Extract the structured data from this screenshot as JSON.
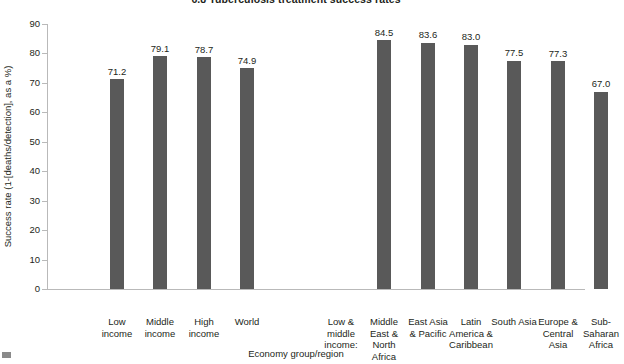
{
  "chart_data": {
    "type": "bar",
    "title": "6.8 Tuberculosis treatment success rates",
    "xlabel": "Economy group/region",
    "ylabel": "Success rate (1-[deaths/detection], as a %)",
    "ylim": [
      0,
      90
    ],
    "ytick_step": 10,
    "ytick_labels": [
      "0",
      "10",
      "20",
      "30",
      "40",
      "50",
      "60",
      "70",
      "80",
      "90"
    ],
    "grid": false,
    "legend": null,
    "bar_color": "#595959",
    "axis_color": "#b9b9b9",
    "groups": [
      {
        "group_label": "",
        "categories": [
          "Low income",
          "Middle income",
          "High income",
          "World"
        ],
        "values": [
          71.2,
          79.1,
          78.7,
          74.9
        ],
        "value_labels": [
          "71.2",
          "79.1",
          "78.7",
          "74.9"
        ]
      },
      {
        "group_label": "Low & middle income:",
        "categories": [
          "Middle East & North Africa",
          "East Asia & Pacific",
          "Latin America & Caribbean",
          "South Asia",
          "Europe & Central Asia",
          "Sub-Saharan Africa"
        ],
        "values": [
          84.5,
          83.6,
          83.0,
          77.5,
          77.3,
          67.0
        ],
        "value_labels": [
          "84.5",
          "83.6",
          "83.0",
          "77.5",
          "77.3",
          "67.0"
        ]
      }
    ],
    "categories": [
      "Low income",
      "Middle income",
      "High income",
      "World",
      "Low & middle income:",
      "Middle East & North Africa",
      "East Asia & Pacific",
      "Latin America & Caribbean",
      "South Asia",
      "Europe & Central Asia",
      "Sub-Saharan Africa"
    ],
    "values": [
      71.2,
      79.1,
      78.7,
      74.9,
      null,
      84.5,
      83.6,
      83.0,
      77.5,
      77.3,
      67.0
    ],
    "bars": [
      {
        "label": "Low income",
        "label_lines": [
          "Low",
          "income"
        ],
        "value": 71.2,
        "value_label": "71.2",
        "cx": 70
      },
      {
        "label": "Middle income",
        "label_lines": [
          "Middle",
          "income"
        ],
        "value": 79.1,
        "value_label": "79.1",
        "cx": 113
      },
      {
        "label": "High income",
        "label_lines": [
          "High",
          "income"
        ],
        "value": 78.7,
        "value_label": "78.7",
        "cx": 157
      },
      {
        "label": "World",
        "label_lines": [
          "World"
        ],
        "value": 74.9,
        "value_label": "74.9",
        "cx": 200
      },
      {
        "label": "Low & middle income:",
        "label_lines": [
          "Low &",
          "middle",
          "income:"
        ],
        "value": null,
        "value_label": "",
        "cx": 294
      },
      {
        "label": "Middle East & North Africa",
        "label_lines": [
          "Middle",
          "East &",
          "North",
          "Africa"
        ],
        "value": 84.5,
        "value_label": "84.5",
        "cx": 337
      },
      {
        "label": "East Asia & Pacific",
        "label_lines": [
          "East Asia",
          "& Pacific"
        ],
        "value": 83.6,
        "value_label": "83.6",
        "cx": 381
      },
      {
        "label": "Latin America & Caribbean",
        "label_lines": [
          "Latin",
          "America &",
          "Caribbean"
        ],
        "value": 83.0,
        "value_label": "83.0",
        "cx": 424
      },
      {
        "label": "South Asia",
        "label_lines": [
          "South Asia"
        ],
        "value": 77.5,
        "value_label": "77.5",
        "cx": 467
      },
      {
        "label": "Europe & Central Asia",
        "label_lines": [
          "Europe &",
          "Central",
          "Asia"
        ],
        "value": 77.3,
        "value_label": "77.3",
        "cx": 511
      },
      {
        "label": "Sub-Saharan Africa",
        "label_lines": [
          "Sub-",
          "Saharan",
          "Africa"
        ],
        "value": 67.0,
        "value_label": "67.0",
        "cx": 554
      }
    ]
  }
}
